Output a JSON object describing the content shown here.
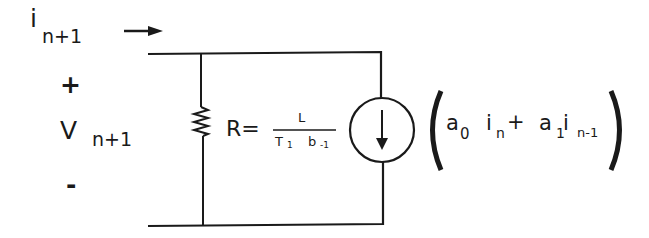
{
  "diagram": {
    "type": "circuit",
    "current_label": {
      "symbol": "i",
      "subscript": "n+1"
    },
    "plus_sign": "+",
    "voltage_label": {
      "symbol": "V",
      "subscript": "n+1"
    },
    "minus_sign": "-",
    "resistor_equation": {
      "lhs": "R=",
      "numerator": "L",
      "denominator_T": "T",
      "denominator_T_sub": "1",
      "denominator_b": "b",
      "denominator_b_sub": "-1"
    },
    "source_expression": {
      "a0": "a",
      "a0_sub": "0",
      "i_n": "i",
      "i_n_sub": "n",
      "plus": "+",
      "a1": "a",
      "a1_sub": "1",
      "i_nm1": "i",
      "i_nm1_sub": "n-1"
    },
    "colors": {
      "line": "#1a1a1a",
      "background": "#ffffff"
    }
  }
}
